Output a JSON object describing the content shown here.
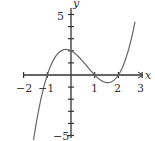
{
  "chart_data": {
    "type": "line",
    "title": "",
    "function": "y = (x+1)(x-1)(x-2)",
    "xlabel": "x",
    "ylabel": "y",
    "xlim": [
      -2,
      3
    ],
    "ylim": [
      -5,
      5
    ],
    "x_tick_labels": [
      "−2",
      "−1",
      "1",
      "2",
      "3"
    ],
    "x_ticks": [
      -2,
      -1,
      1,
      2,
      3
    ],
    "y_tick_labels": [
      "5",
      "−5"
    ],
    "y_ticks": [
      -5,
      -4,
      -3,
      -2,
      -1,
      1,
      2,
      3,
      4,
      5
    ],
    "roots": [
      -1,
      1,
      2
    ],
    "y_intercept": 2,
    "grid": false,
    "series": [
      {
        "name": "curve",
        "x": [
          -1.6,
          -1.5,
          -1.25,
          -1,
          -0.75,
          -0.5,
          -0.25,
          0,
          0.25,
          0.5,
          0.75,
          1,
          1.25,
          1.5,
          1.75,
          2,
          2.25,
          2.5,
          2.75,
          3.0
        ],
        "y": [
          -5.62,
          -4.38,
          -2.05,
          0,
          1.53,
          2.63,
          2.23,
          2,
          1.55,
          1.13,
          0.55,
          0,
          -0.52,
          -0.63,
          -0.48,
          0,
          0.8,
          2.63,
          4.08,
          8
        ]
      }
    ],
    "color": "#555555"
  },
  "labels": {
    "x_axis": "x",
    "y_axis": "y",
    "tick_neg2": "−2",
    "tick_neg1": "−1",
    "tick_1": "1",
    "tick_2": "2",
    "tick_3": "3",
    "tick_y5": "5",
    "tick_yneg5": "−5"
  }
}
